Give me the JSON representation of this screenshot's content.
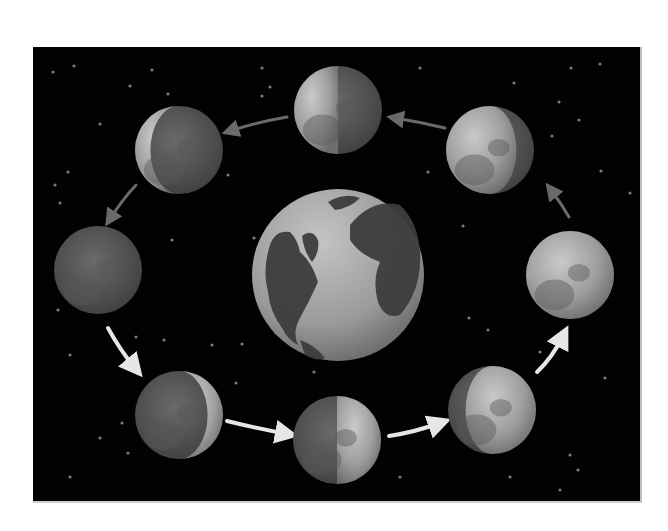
{
  "diagram": {
    "background_color": "#020202",
    "panel": {
      "x": 33,
      "y": 47,
      "width": 609,
      "height": 456
    },
    "earth": {
      "name": "Earth",
      "cx": 338,
      "cy": 275,
      "r": 86,
      "ocean_color": "#a9a9a9",
      "land_color": "#3d3d3d"
    },
    "moons": [
      {
        "id": "new-moon",
        "label": "New moon",
        "cx": 98,
        "cy": 270,
        "r": 44,
        "lit": "none"
      },
      {
        "id": "waxing-crescent",
        "label": "Waxing crescent",
        "cx": 179,
        "cy": 415,
        "r": 44,
        "lit": "right-crescent"
      },
      {
        "id": "first-quarter",
        "label": "First quarter",
        "cx": 337,
        "cy": 440,
        "r": 44,
        "lit": "right-half"
      },
      {
        "id": "waxing-gibbous",
        "label": "Waxing gibbous",
        "cx": 492,
        "cy": 410,
        "r": 44,
        "lit": "right-gibbous"
      },
      {
        "id": "full-moon",
        "label": "Full moon",
        "cx": 570,
        "cy": 275,
        "r": 44,
        "lit": "full"
      },
      {
        "id": "waning-gibbous",
        "label": "Waning gibbous",
        "cx": 490,
        "cy": 150,
        "r": 44,
        "lit": "left-gibbous"
      },
      {
        "id": "third-quarter",
        "label": "Third quarter",
        "cx": 338,
        "cy": 110,
        "r": 44,
        "lit": "left-half"
      },
      {
        "id": "waning-crescent",
        "label": "Waning crescent",
        "cx": 179,
        "cy": 150,
        "r": 44,
        "lit": "left-crescent"
      }
    ],
    "arrows": [
      {
        "id": "arrow-new-to-waxing-crescent",
        "path": "M108 328 Q120 350 135 368",
        "color": "#e6e6e6"
      },
      {
        "id": "arrow-waxing-crescent-to-first-quarter",
        "path": "M227 421 Q255 428 287 434",
        "color": "#e6e6e6"
      },
      {
        "id": "arrow-first-quarter-to-waxing-gibbous",
        "path": "M389 436 Q415 432 440 423",
        "color": "#e6e6e6"
      },
      {
        "id": "arrow-waxing-gibbous-to-full",
        "path": "M537 372 Q552 358 563 336",
        "color": "#e6e6e6"
      },
      {
        "id": "arrow-full-to-waning-gibbous",
        "path": "M569 217 Q561 203 551 190",
        "color": "#6a6a6a"
      },
      {
        "id": "arrow-waning-gibbous-to-third-quarter",
        "path": "M445 128 Q420 122 395 118",
        "color": "#6a6a6a"
      },
      {
        "id": "arrow-third-quarter-to-waning-crescent",
        "path": "M287 117 Q258 122 230 131",
        "color": "#6a6a6a"
      },
      {
        "id": "arrow-waning-crescent-to-new",
        "path": "M136 185 Q122 200 110 219",
        "color": "#6a6a6a"
      }
    ],
    "stars": [
      [
        53,
        72
      ],
      [
        74,
        66
      ],
      [
        152,
        70
      ],
      [
        130,
        86
      ],
      [
        168,
        94
      ],
      [
        100,
        124
      ],
      [
        68,
        172
      ],
      [
        55,
        185
      ],
      [
        60,
        203
      ],
      [
        228,
        175
      ],
      [
        262,
        96
      ],
      [
        270,
        87
      ],
      [
        254,
        238
      ],
      [
        172,
        240
      ],
      [
        262,
        68
      ],
      [
        420,
        68
      ],
      [
        514,
        83
      ],
      [
        571,
        68
      ],
      [
        600,
        64
      ],
      [
        559,
        102
      ],
      [
        579,
        120
      ],
      [
        552,
        136
      ],
      [
        601,
        171
      ],
      [
        630,
        193
      ],
      [
        428,
        172
      ],
      [
        463,
        226
      ],
      [
        469,
        318
      ],
      [
        488,
        330
      ],
      [
        540,
        352
      ],
      [
        605,
        378
      ],
      [
        570,
        455
      ],
      [
        578,
        470
      ],
      [
        510,
        477
      ],
      [
        400,
        477
      ],
      [
        560,
        490
      ],
      [
        58,
        310
      ],
      [
        70,
        355
      ],
      [
        136,
        337
      ],
      [
        164,
        340
      ],
      [
        212,
        345
      ],
      [
        242,
        344
      ],
      [
        314,
        372
      ],
      [
        236,
        383
      ],
      [
        122,
        423
      ],
      [
        100,
        438
      ],
      [
        128,
        453
      ],
      [
        70,
        477
      ],
      [
        276,
        333
      ]
    ]
  }
}
